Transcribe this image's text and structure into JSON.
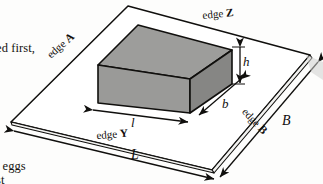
{
  "figure": {
    "caption_fragments": {
      "line_upper": "ed first,",
      "line_lower_1": "r eggs",
      "line_lower_2": "st"
    },
    "plate": {
      "edge_labels": [
        {
          "id": "edge-a",
          "prefix": "edge ",
          "letter": "A"
        },
        {
          "id": "edge-z",
          "prefix": "edge ",
          "letter": "Z"
        },
        {
          "id": "edge-b",
          "prefix": "edge ",
          "letter": "B"
        },
        {
          "id": "edge-y",
          "prefix": "edge ",
          "letter": "Y"
        }
      ],
      "dimensions": [
        {
          "id": "plate-length",
          "symbol": "L"
        },
        {
          "id": "plate-breadth",
          "symbol": "B"
        }
      ]
    },
    "block": {
      "dimensions": [
        {
          "id": "block-length",
          "symbol": "l"
        },
        {
          "id": "block-breadth",
          "symbol": "b"
        },
        {
          "id": "block-height",
          "symbol": "h"
        }
      ]
    },
    "colors": {
      "line": "#100f0d",
      "block_top": "#9d9d9b",
      "block_front": "#9a9a98",
      "block_side": "#868684",
      "background": "#fdfdfc"
    }
  }
}
